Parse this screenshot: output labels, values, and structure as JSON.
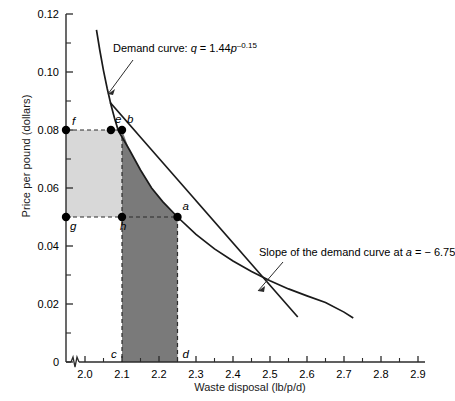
{
  "chart_data": {
    "type": "line",
    "title": "",
    "xlabel": "Waste disposal (lb/p/d)",
    "ylabel": "Price per pound (dollars)",
    "xlim": [
      1.97,
      2.93
    ],
    "ylim": [
      0,
      0.12
    ],
    "xticks": [
      "2.0",
      "2.1",
      "2.2",
      "2.3",
      "2.4",
      "2.5",
      "2.6",
      "2.7",
      "2.8",
      "2.9"
    ],
    "xtick_values": [
      2.0,
      2.1,
      2.2,
      2.3,
      2.4,
      2.5,
      2.6,
      2.7,
      2.8,
      2.9
    ],
    "yticks": [
      "0",
      "0.02",
      "0.04",
      "0.06",
      "0.08",
      "0.10",
      "0.12"
    ],
    "ytick_values": [
      0,
      0.02,
      0.04,
      0.06,
      0.08,
      0.1,
      0.12
    ],
    "y_minor_ticks": [
      0.01,
      0.03,
      0.05,
      0.07,
      0.09,
      0.11
    ],
    "grid": false,
    "legend": "none",
    "axis_break": "x-axis break between 0 and 2.0",
    "series": [
      {
        "name": "Demand curve",
        "equation": "q = 1.44p^-0.15",
        "type": "curve",
        "points": [
          {
            "x": 2.031,
            "y": 0.1145
          },
          {
            "x": 2.04,
            "y": 0.1075
          },
          {
            "x": 2.05,
            "y": 0.1005
          },
          {
            "x": 2.06,
            "y": 0.0943
          },
          {
            "x": 2.07,
            "y": 0.0888
          },
          {
            "x": 2.08,
            "y": 0.084
          },
          {
            "x": 2.09,
            "y": 0.0798
          },
          {
            "x": 2.1,
            "y": 0.08
          },
          {
            "x": 2.12,
            "y": 0.0732
          },
          {
            "x": 2.15,
            "y": 0.0662
          },
          {
            "x": 2.18,
            "y": 0.06
          },
          {
            "x": 2.21,
            "y": 0.0553
          },
          {
            "x": 2.25,
            "y": 0.05
          },
          {
            "x": 2.3,
            "y": 0.044
          },
          {
            "x": 2.35,
            "y": 0.039
          },
          {
            "x": 2.4,
            "y": 0.0348
          },
          {
            "x": 2.45,
            "y": 0.0312
          },
          {
            "x": 2.5,
            "y": 0.028
          },
          {
            "x": 2.55,
            "y": 0.0252
          },
          {
            "x": 2.6,
            "y": 0.0228
          },
          {
            "x": 2.65,
            "y": 0.0205
          },
          {
            "x": 2.7,
            "y": 0.0172
          },
          {
            "x": 2.725,
            "y": 0.0152
          }
        ]
      },
      {
        "name": "Tangent line at a",
        "slope": -6.75,
        "type": "line",
        "points": [
          {
            "x": 2.068,
            "y": 0.0895
          },
          {
            "x": 2.575,
            "y": 0.0155
          }
        ]
      }
    ],
    "marked_points": [
      {
        "label": "f",
        "x": 1.985,
        "y": 0.08,
        "on_axis": true
      },
      {
        "label": "e",
        "x": 2.07,
        "y": 0.08
      },
      {
        "label": "b",
        "x": 2.1,
        "y": 0.08
      },
      {
        "label": "g",
        "x": 1.985,
        "y": 0.05,
        "on_axis": true
      },
      {
        "label": "h",
        "x": 2.1,
        "y": 0.05
      },
      {
        "label": "a",
        "x": 2.25,
        "y": 0.05
      },
      {
        "label": "c",
        "x": 2.1,
        "y": 0.0
      },
      {
        "label": "d",
        "x": 2.25,
        "y": 0.0
      }
    ],
    "shaded_regions": [
      {
        "name": "light-gray-rectangle-fghe",
        "color": "#d8d8d8",
        "description": "rectangle from y-axis to x=2.10 between p=0.05 and p=0.08"
      },
      {
        "name": "dark-gray-region-bcda",
        "color": "#7a7a7a",
        "description": "region under demand curve from b(2.10,0.08) to a(2.25,0.05) down to c(2.10,0) and d(2.25,0)"
      }
    ],
    "annotations": [
      {
        "name": "demand-curve-label",
        "text_prefix": "Demand curve:  ",
        "var_q": "q",
        "equals": " = 1.44",
        "var_p": "p",
        "exponent": "–0.15",
        "full_text": "Demand curve: q = 1.44p−0.15"
      },
      {
        "name": "slope-label",
        "text": "Slope of the demand curve at a = − 6.75",
        "prefix": "Slope of the demand curve at ",
        "var_a": "a",
        "suffix": " = − 6.75"
      }
    ],
    "colors": {
      "axis": "#2b2b2b",
      "curve": "#1a1a1a",
      "light_shade": "#d8d8d8",
      "dark_shade": "#7a7a7a",
      "dashed": "#2b2b2b",
      "point": "#000000"
    }
  }
}
